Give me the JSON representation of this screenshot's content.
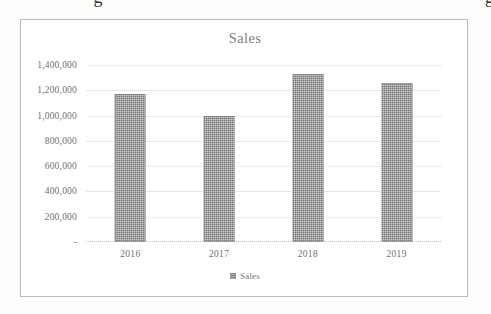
{
  "page": {
    "background_color": "#fdfdfc",
    "clipped_heading_fragment": "g g"
  },
  "chart_frame": {
    "border_color": "#b9bcbe",
    "background_color": "#ffffff"
  },
  "legend": {
    "position": "bottom",
    "swatch_icon": "series-color-swatch",
    "entries": [
      "Sales"
    ]
  },
  "axis": {
    "y_tick_labels": [
      "1,400,000",
      "1,200,000",
      "1,000,000",
      "800,000",
      "600,000",
      "400,000",
      "200,000",
      "-"
    ],
    "x_tick_labels": [
      "2016",
      "2017",
      "2018",
      "2019"
    ]
  },
  "chart_data": {
    "type": "bar",
    "title": "Sales",
    "xlabel": "",
    "ylabel": "",
    "categories": [
      "2016",
      "2017",
      "2018",
      "2019"
    ],
    "values": [
      1170000,
      1000000,
      1330000,
      1260000
    ],
    "series": [
      {
        "name": "Sales",
        "values": [
          1170000,
          1000000,
          1330000,
          1260000
        ],
        "color": "#8e8e8e"
      }
    ],
    "ylim": [
      0,
      1400000
    ],
    "y_tick_step": 200000,
    "y_tick_values": [
      0,
      200000,
      400000,
      600000,
      800000,
      1000000,
      1200000,
      1400000
    ],
    "zero_tick_display": "-",
    "grid": true,
    "grid_axis": "y",
    "grid_color": "#dcdcdc",
    "legend": true,
    "legend_position": "bottom",
    "legend_entries": [
      "Sales"
    ],
    "number_format": "#,##0"
  }
}
